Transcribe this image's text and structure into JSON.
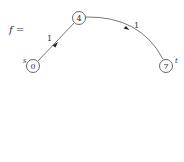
{
  "diagram": {
    "title_label": "f =",
    "nodes": [
      {
        "id": "s",
        "value": "0",
        "side_label": "s",
        "cx": 33,
        "cy": 66
      },
      {
        "id": "m",
        "value": "4",
        "side_label": "",
        "cx": 79,
        "cy": 18
      },
      {
        "id": "t",
        "value": "7",
        "side_label": "t",
        "cx": 166,
        "cy": 66
      }
    ],
    "edges": [
      {
        "from": "m",
        "to": "s",
        "label": "1"
      },
      {
        "from": "m",
        "to": "t",
        "label": "1"
      }
    ],
    "colors": {
      "stroke": "#555555",
      "text": "#333333",
      "background": "#ffffff"
    }
  }
}
